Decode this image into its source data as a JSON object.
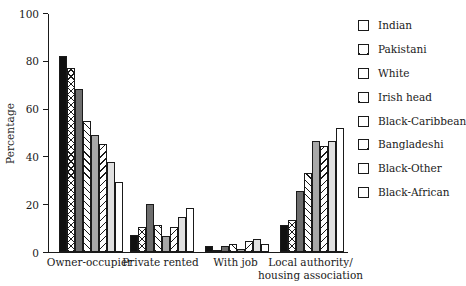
{
  "chart_data": {
    "type": "bar",
    "title": "",
    "xlabel": "",
    "ylabel": "Percentage",
    "ylim": [
      0,
      100
    ],
    "yticks": [
      0,
      20,
      40,
      60,
      80,
      100
    ],
    "grid": false,
    "legend_position": "right",
    "categories": [
      "Owner-occupier",
      "Private rented",
      "With job",
      "Local authority/\nhousing association"
    ],
    "series": [
      {
        "name": "Indian",
        "pattern": "solid-black",
        "values": [
          82,
          7,
          2.5,
          11.5
        ]
      },
      {
        "name": "Pakistani",
        "pattern": "cross-hatch",
        "values": [
          77,
          10.5,
          1,
          13.5
        ]
      },
      {
        "name": "White",
        "pattern": "dark-gray",
        "values": [
          68,
          20,
          2.5,
          25.5
        ]
      },
      {
        "name": "Irish head",
        "pattern": "diag-back",
        "values": [
          55,
          11.5,
          3.5,
          33
        ]
      },
      {
        "name": "Black-Caribbean",
        "pattern": "mid-gray",
        "values": [
          49,
          6.5,
          1.2,
          46.5
        ]
      },
      {
        "name": "Bangladeshi",
        "pattern": "diag-fwd",
        "values": [
          45,
          10.5,
          4.5,
          44.5
        ]
      },
      {
        "name": "Black-Other",
        "pattern": "light-gray",
        "values": [
          37.5,
          14.5,
          5.5,
          46.5
        ]
      },
      {
        "name": "Black-African",
        "pattern": "white",
        "values": [
          29.5,
          18.5,
          3.5,
          52
        ]
      }
    ]
  }
}
